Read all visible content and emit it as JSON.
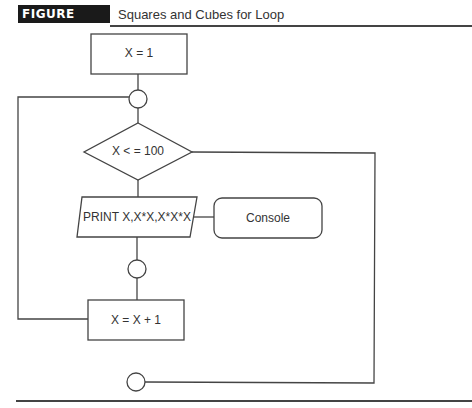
{
  "figure": {
    "label": "FIGURE 5.20",
    "title": "Squares and Cubes for Loop"
  },
  "nodes": {
    "init": {
      "type": "process",
      "text": "X = 1"
    },
    "connector_top": {
      "type": "connector"
    },
    "condition": {
      "type": "decision",
      "text": "X < = 100"
    },
    "print": {
      "type": "input-output",
      "text": "PRINT X,X*X,X*X*X"
    },
    "console": {
      "type": "terminal-device",
      "text": "Console"
    },
    "connector_mid": {
      "type": "connector"
    },
    "increment": {
      "type": "process",
      "text": "X = X + 1"
    },
    "connector_end": {
      "type": "connector"
    }
  },
  "edges": [
    {
      "from": "init",
      "to": "connector_top"
    },
    {
      "from": "connector_top",
      "to": "condition"
    },
    {
      "from": "condition",
      "to": "print",
      "label": ""
    },
    {
      "from": "print",
      "to": "console"
    },
    {
      "from": "print",
      "to": "connector_mid"
    },
    {
      "from": "connector_mid",
      "to": "increment"
    },
    {
      "from": "increment",
      "to": "connector_top"
    },
    {
      "from": "condition",
      "to": "connector_end",
      "label": ""
    }
  ],
  "colors": {
    "stroke": "#444444",
    "label_bg": "#1a1a1a",
    "text": "#333333"
  }
}
